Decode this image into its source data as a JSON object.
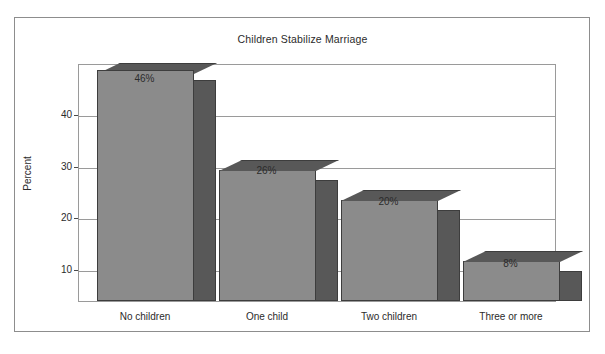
{
  "chart_data": {
    "type": "bar",
    "title": "Children Stabilize Marriage",
    "xlabel": "",
    "ylabel": "Percent",
    "categories": [
      "No children",
      "One child",
      "Two children",
      "Three or more"
    ],
    "values": [
      46,
      26,
      20,
      8
    ],
    "value_labels": [
      "46%",
      "26%",
      "20%",
      "8%"
    ],
    "ytick_labels": [
      "10",
      "20",
      "30",
      "40"
    ],
    "yticks": [
      10,
      20,
      30,
      40
    ],
    "ylim": [
      0,
      46
    ],
    "grid": "horizontal",
    "legend": "none",
    "style": {
      "bar_face_color": "#8b8b8b",
      "bar_side_color": "#585858",
      "bar_top_color": "#6e6e6e",
      "bar_edge_color": "#3d3d3d",
      "grid_color": "#9a9a9a",
      "frame_color": "#8d8d8d",
      "text_color": "#2b2b2b",
      "background_color": "#ffffff"
    }
  }
}
